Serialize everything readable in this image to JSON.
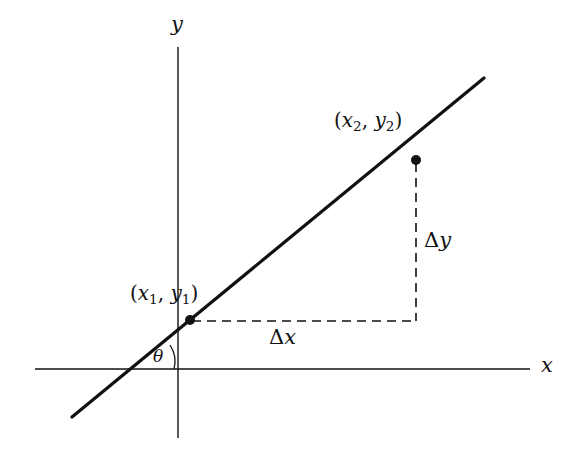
{
  "diagram": {
    "axes": {
      "x_label": "x",
      "y_label": "y"
    },
    "points": [
      {
        "name": "point-1",
        "label_open": "(",
        "var_x": "x",
        "sub_x": "1",
        "comma": ", ",
        "var_y": "y",
        "sub_y": "1",
        "label_close": ")"
      },
      {
        "name": "point-2",
        "label_open": "(",
        "var_x": "x",
        "sub_x": "2",
        "comma": ", ",
        "var_y": "y",
        "sub_y": "2",
        "label_close": ")"
      }
    ],
    "delta_x": {
      "symbol": "Δ",
      "var": "x"
    },
    "delta_y": {
      "symbol": "Δ",
      "var": "y"
    },
    "angle_label": "θ",
    "colors": {
      "ink": "#111111",
      "background": "#ffffff"
    }
  }
}
